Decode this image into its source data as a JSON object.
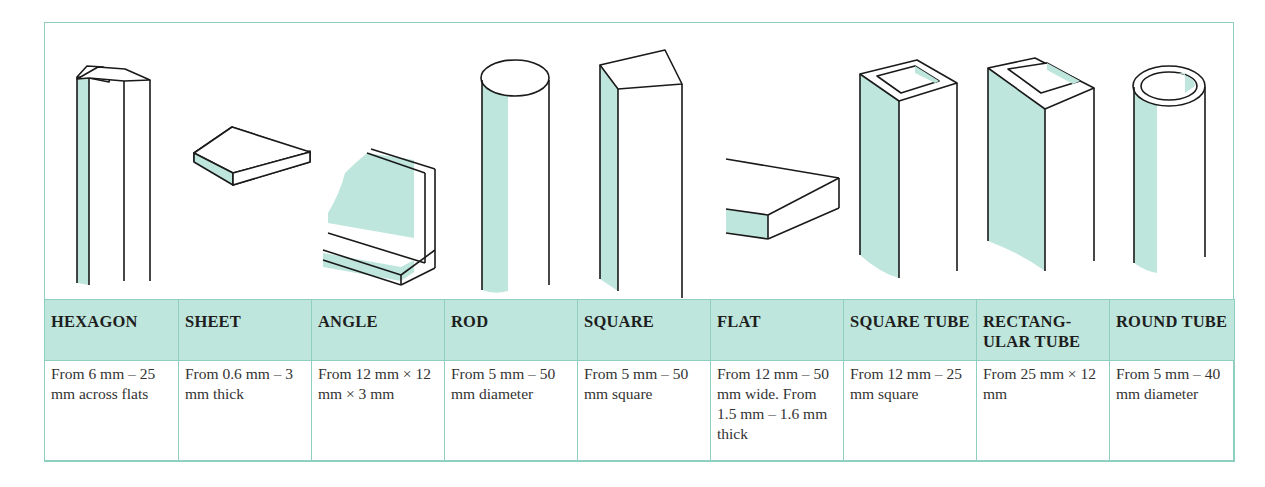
{
  "figure": {
    "accent_color": "#bfe6dc",
    "border_color": "#8fcfbf",
    "shapes": [
      {
        "id": "hexagon",
        "header": "HEXAGON",
        "description": "From 6 mm – 25 mm across flats",
        "icon": "hexagon-bar-icon"
      },
      {
        "id": "sheet",
        "header": "SHEET",
        "description": "From 0.6 mm – 3 mm thick",
        "icon": "sheet-icon"
      },
      {
        "id": "angle",
        "header": "ANGLE",
        "description": "From 12 mm × 12 mm × 3 mm",
        "icon": "angle-icon"
      },
      {
        "id": "rod",
        "header": "ROD",
        "description": "From 5 mm – 50 mm diameter",
        "icon": "rod-icon"
      },
      {
        "id": "square",
        "header": "SQUARE",
        "description": "From 5 mm – 50 mm square",
        "icon": "square-bar-icon"
      },
      {
        "id": "flat",
        "header": "FLAT",
        "description": "From 12 mm – 50 mm wide. From 1.5 mm – 1.6 mm thick",
        "icon": "flat-bar-icon"
      },
      {
        "id": "square-tube",
        "header": "SQUARE TUBE",
        "description": "From 12 mm – 25 mm square",
        "icon": "square-tube-icon"
      },
      {
        "id": "rectangular-tube",
        "header": "RECTANG-ULAR TUBE",
        "description": "From 25 mm × 12 mm",
        "icon": "rectangular-tube-icon"
      },
      {
        "id": "round-tube",
        "header": "ROUND TUBE",
        "description": "From 5 mm – 40 mm diameter",
        "icon": "round-tube-icon"
      }
    ]
  }
}
